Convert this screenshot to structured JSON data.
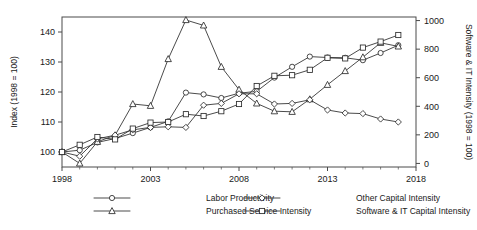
{
  "chart_data": {
    "type": "line",
    "title": "",
    "xlabel": "",
    "ylabel": "Index (1998 = 100)",
    "y2label": "Software & IT Intensity (1998 = 100)",
    "xlim": [
      1998,
      2018
    ],
    "ylim": [
      95,
      145
    ],
    "y2lim": [
      -25,
      1025
    ],
    "xticks": [
      1998,
      2003,
      2008,
      2013,
      2018
    ],
    "yticks": [
      100,
      110,
      120,
      130,
      140
    ],
    "y2ticks": [
      0,
      200,
      400,
      600,
      800,
      1000
    ],
    "grid": false,
    "legend_position": "bottom",
    "x": [
      1998,
      1999,
      2000,
      2001,
      2002,
      2003,
      2004,
      2005,
      2006,
      2007,
      2008,
      2009,
      2010,
      2011,
      2012,
      2013,
      2014,
      2015,
      2016,
      2017
    ],
    "series": [
      {
        "name": "Labor Productivity",
        "marker": "circle",
        "axis": "left",
        "values": [
          100.0,
          100.6,
          103.2,
          104.5,
          106.3,
          108.2,
          110.2,
          119.8,
          119.2,
          118.0,
          119.6,
          120.2,
          124.8,
          128.4,
          131.8,
          131.5,
          131.4,
          130.6,
          133.0,
          135.6
        ]
      },
      {
        "name": "Purchased Service Intensity",
        "marker": "triangle",
        "axis": "left",
        "values": [
          100.0,
          96.2,
          103.4,
          105.6,
          116.0,
          115.4,
          131.0,
          144.0,
          142.2,
          128.4,
          120.8,
          116.2,
          113.6,
          113.4,
          117.6,
          122.4,
          127.0,
          131.6,
          136.4,
          135.2
        ]
      },
      {
        "name": "Other Capital Intensity",
        "marker": "diamond",
        "axis": "left",
        "values": [
          100.0,
          98.6,
          104.4,
          105.6,
          107.4,
          108.2,
          108.4,
          108.2,
          115.6,
          116.2,
          119.4,
          119.4,
          116.0,
          116.2,
          117.4,
          114.0,
          113.0,
          112.8,
          111.0,
          110.0
        ]
      },
      {
        "name": "Software & IT Capital Intensity",
        "marker": "square",
        "axis": "right",
        "values": [
          100.0,
          102.4,
          105.0,
          104.2,
          107.8,
          109.8,
          110.0,
          112.6,
          112.0,
          113.6,
          116.0,
          122.0,
          125.4,
          125.6,
          127.4,
          131.4,
          131.2,
          134.8,
          136.8,
          139.0
        ]
      }
    ]
  },
  "legend": {
    "items": [
      {
        "label": "Labor Productivity",
        "marker": "circle"
      },
      {
        "label": "Other Capital Intensity",
        "marker": "diamond"
      },
      {
        "label": "Purchased Service Intensity",
        "marker": "triangle"
      },
      {
        "label": "Software & IT Capital Intensity",
        "marker": "square"
      }
    ]
  }
}
